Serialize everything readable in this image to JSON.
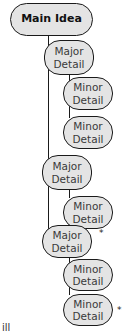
{
  "diagram": {
    "type": "hierarchical-outline",
    "colors": {
      "node_fill": "#e4e4e4",
      "node_border": "#1a1a1a",
      "connector": "#1a1a1a"
    },
    "main": {
      "label": "Main Idea"
    },
    "nodes": [
      {
        "level": "major",
        "line1": "Major",
        "line2": "Detail",
        "starred": false
      },
      {
        "level": "minor",
        "line1": "Minor",
        "line2": "Detail",
        "starred": false
      },
      {
        "level": "minor",
        "line1": "Minor",
        "line2": "Detail",
        "starred": false
      },
      {
        "level": "major",
        "line1": "Major",
        "line2": "Detail",
        "starred": false
      },
      {
        "level": "minor",
        "line1": "Minor",
        "line2": "Detail",
        "starred": false
      },
      {
        "level": "major",
        "line1": "Major",
        "line2": "Detail",
        "starred": true
      },
      {
        "level": "minor",
        "line1": "Minor",
        "line2": "Detail",
        "starred": false
      },
      {
        "level": "minor",
        "line1": "Minor",
        "line2": "Detail",
        "starred": true
      }
    ],
    "star_glyph": "*",
    "caption_fragment": "ill"
  }
}
